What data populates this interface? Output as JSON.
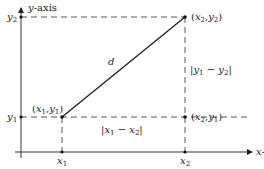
{
  "diagram": {
    "axes": {
      "x_label_var": "x",
      "x_label_suffix": "-axis",
      "y_label_var": "y",
      "y_label_suffix": "-axis"
    },
    "ticks": {
      "x1": {
        "var": "x",
        "sub": "1"
      },
      "x2": {
        "var": "x",
        "sub": "2"
      },
      "y1": {
        "var": "y",
        "sub": "1"
      },
      "y2": {
        "var": "y",
        "sub": "2"
      }
    },
    "points": {
      "p1": {
        "label_open": "(",
        "a": "x",
        "a_sub": "1",
        "sep": ",",
        "b": "y",
        "b_sub": "1",
        "label_close": ")"
      },
      "p2": {
        "label_open": "(",
        "a": "x",
        "a_sub": "2",
        "sep": ",",
        "b": "y",
        "b_sub": "2",
        "label_close": ")"
      },
      "p3": {
        "label_open": "(",
        "a": "x",
        "a_sub": "2",
        "sep": ",",
        "b": "y",
        "b_sub": "1",
        "label_close": ")"
      }
    },
    "segments": {
      "distance_label": "d",
      "horizontal": {
        "bar": "|",
        "a": "x",
        "a_sub": "1",
        "op": " − ",
        "b": "x",
        "b_sub": "2"
      },
      "vertical": {
        "bar": "|",
        "a": "y",
        "a_sub": "1",
        "op": " − ",
        "b": "y",
        "b_sub": "2"
      }
    },
    "colors": {
      "line": "#222222",
      "dashed": "#444444",
      "background": "#ffffff"
    }
  }
}
